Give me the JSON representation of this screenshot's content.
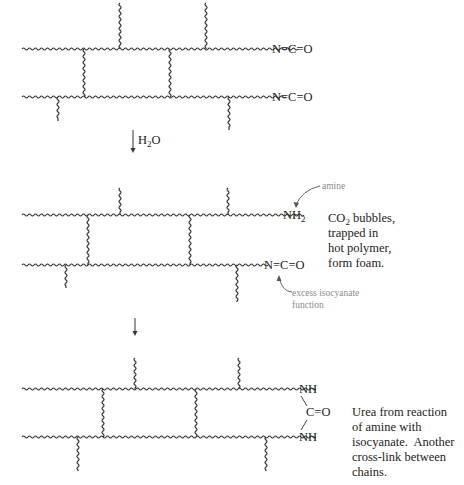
{
  "figure": {
    "panel_1": {
      "top_chain_end_group": "N=C=O",
      "bottom_chain_end_group": "N=C=O"
    },
    "step_1": {
      "reagent": "H",
      "reagent_sub": "2",
      "reagent_tail": "O"
    },
    "panel_2": {
      "top_chain_end_group": "NH",
      "top_chain_end_sub": "2",
      "bottom_chain_end_group": "N=C=O",
      "amine_label": "amine",
      "isocyanate_label_line1": "excess isocyanate",
      "isocyanate_label_line2": "function",
      "note_line1_pre": "CO",
      "note_line1_sub": "2",
      "note_line1_post": " bubbles,",
      "note_line2": "trapped in",
      "note_line3": "hot polymer,",
      "note_line4": "form foam."
    },
    "panel_3": {
      "top_chain_end_group": "NH",
      "carbonyl": "C=O",
      "bottom_chain_end_group": "NH",
      "note_line1": "Urea from reaction",
      "note_line2": "of amine with",
      "note_line3": "isocyanate.  Another",
      "note_line4": "cross-link between",
      "note_line5": "chains."
    }
  }
}
